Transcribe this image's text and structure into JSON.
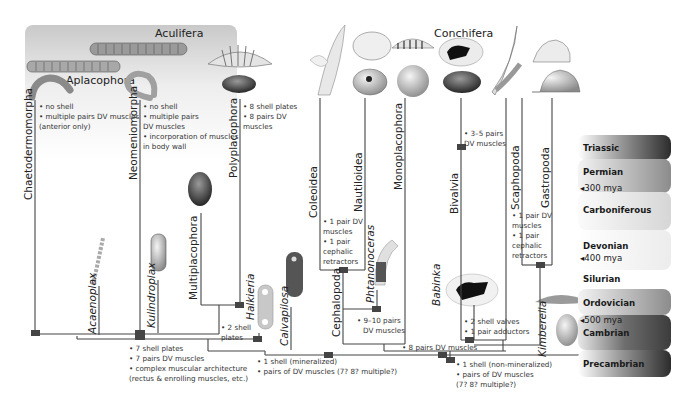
{
  "groups": {
    "aculifera": "Aculifera",
    "aplacophora": "Aplacophora",
    "conchifera": "Conchifera"
  },
  "taxa": {
    "chaetodermomorpha": "Chaetodermomorpha",
    "neomeniomorpha": "Neomeniomorpha",
    "polyplacophora": "Polyplacophora",
    "multiplacophora": "Multiplacophora",
    "acaenoplax": "Acaenoplax",
    "kulindroplax": "Kulindroplax",
    "halkieria": "Halkieria",
    "calvapilosa": "Calvapilosa",
    "coleoidea": "Coleoidea",
    "nautiloidea": "Nautiloidea",
    "monoplacophora": "Monoplacophora",
    "cephalopoda": "Cephalopoda",
    "phtanonoceras": "Phtanonoceras",
    "bivalvia": "Bivalvia",
    "babinka": "Babinka",
    "scaphopoda": "Scaphopoda",
    "gastropoda": "Gastropoda",
    "kimberella": "Kimberella"
  },
  "notes": {
    "chaetodermomorpha": [
      "• no shell",
      "• multiple pairs DV muscles",
      "(anterior only)"
    ],
    "neomeniomorpha": [
      "• no shell",
      "• multiple pairs",
      "DV muscles",
      "• incorporation of muscles",
      "in body wall"
    ],
    "polyplacophora": [
      "• 8 shell plates",
      "• 8 pairs DV",
      "muscles"
    ],
    "aculifera_node": [
      "• 7 shell plates",
      "• 7 pairs DV muscles",
      "• complex muscular architecture",
      "(rectus & enrolling muscles, etc.)"
    ],
    "halkieria_node": [
      "• 2 shell",
      "plates"
    ],
    "mollusca_node": [
      "• 1 shell (mineralized)",
      "• pairs of DV muscles (7? 8? multiple?)"
    ],
    "cephalopod_node": [
      "• 1 pair DV",
      "muscles",
      "• 1 pair",
      "cephalic",
      "retractors"
    ],
    "phtanonoceras_node": [
      "• 9–10 pairs",
      "DV muscles"
    ],
    "bivalvia_node": [
      "• 3–5 pairs",
      "DV muscles"
    ],
    "babinka_node": [
      "• 2 shell valves",
      "• 1 pair adductors"
    ],
    "gastropoda_node": [
      "• 1 pair DV",
      "muscles",
      "• 1 pair",
      "cephalic",
      "retractors"
    ],
    "conchifera_node": "• 8 pairs DV muscles",
    "kimberella_node": [
      "• 1 shell (non-mineralized)",
      "• pairs of DV muscles",
      "(7? 8? multiple?)"
    ]
  },
  "timescale": [
    {
      "period": "Triassic",
      "color": "#3a3a3a"
    },
    {
      "period": "Permian",
      "color": "#8a8a8a",
      "mya": "◂300 mya"
    },
    {
      "period": "Carboniferous",
      "color": "#bdbdbd"
    },
    {
      "period": "Devonian",
      "color": "#e2e2e2",
      "mya": "◂400 mya"
    },
    {
      "period": "Silurian",
      "color": "#f3f3f3"
    },
    {
      "period": "Ordovician",
      "color": "#9a9a9a"
    },
    {
      "period": "Cambrian",
      "color": "#505050",
      "mya": "◂500 mya"
    },
    {
      "period": "Precambrian",
      "color": "#3a3a3a"
    }
  ],
  "colors": {
    "aculifera_panel": "#d9d9d9",
    "lines": "#444444",
    "nodes": "#444444"
  }
}
